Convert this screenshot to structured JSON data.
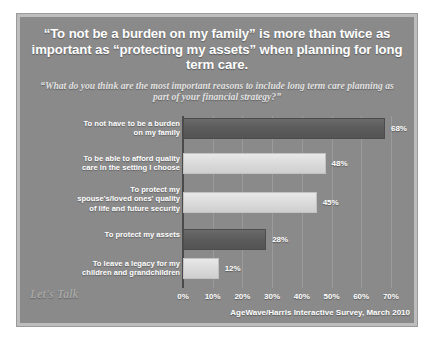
{
  "slide": {
    "headline": "“To not be a burden on my family” is more than twice as important as “protecting my assets” when planning for long term care.",
    "subhead": "“What do you think are the most important reasons to include long term care planning as part of your financial strategy?”",
    "logo": "Let's Talk",
    "attribution": "AgeWave/Harris Interactive Survey, March 2010",
    "colors": {
      "background": "#8a8a8a",
      "frame": "#bdbdbd",
      "bar_dark": "#5c5c5c",
      "bar_light": "#dcdcdc",
      "text": "#ffffff"
    }
  },
  "chart_data": {
    "type": "bar",
    "orientation": "horizontal",
    "title": "“To not be a burden on my family” is more than twice as important as “protecting my assets” when planning for long term care.",
    "subtitle": "“What do you think are the most important reasons to include long term care planning as part of your financial strategy?”",
    "xlabel": "",
    "ylabel": "",
    "xlim": [
      0,
      70
    ],
    "grid": true,
    "legend": "none",
    "xticks": [
      "0%",
      "10%",
      "20%",
      "30%",
      "40%",
      "50%",
      "60%",
      "70%"
    ],
    "xtick_values": [
      0,
      10,
      20,
      30,
      40,
      50,
      60,
      70
    ],
    "categories": [
      "To not have to be a burden on my family",
      "To be able to afford quality care in the setting I choose",
      "To protect my spouse's/loved ones' quality of life and future security",
      "To protect my assets",
      "To leave a legacy for my children and grandchildren"
    ],
    "values": [
      68,
      48,
      45,
      28,
      12
    ],
    "data_labels": [
      "68%",
      "48%",
      "45%",
      "28%",
      "12%"
    ],
    "bar_styles": [
      "dark",
      "light",
      "light",
      "dark",
      "light"
    ]
  },
  "rows": [
    {
      "label_lines": [
        "To not have to be a burden",
        "on my family"
      ],
      "value": 68,
      "value_label": "68%",
      "style": "dark"
    },
    {
      "label_lines": [
        "To be able to afford quality",
        "care in the setting I choose"
      ],
      "value": 48,
      "value_label": "48%",
      "style": "light"
    },
    {
      "label_lines": [
        "To protect my",
        "spouse's/loved ones' quality",
        "of life and future security"
      ],
      "value": 45,
      "value_label": "45%",
      "style": "light"
    },
    {
      "label_lines": [
        "To protect my assets"
      ],
      "value": 28,
      "value_label": "28%",
      "style": "dark"
    },
    {
      "label_lines": [
        "To leave a legacy for my",
        "children and grandchildren"
      ],
      "value": 12,
      "value_label": "12%",
      "style": "light"
    }
  ]
}
